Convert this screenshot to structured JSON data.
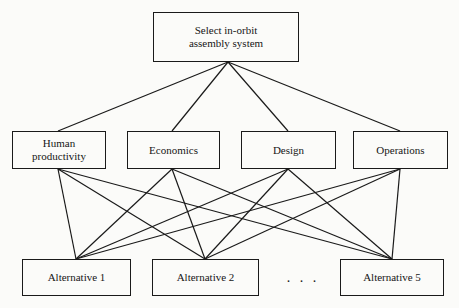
{
  "diagram": {
    "title": "Select in-orbit assembly system",
    "type": "hierarchy-tree",
    "background_color": "#fbfbf9",
    "line_color": "#1a1a1a",
    "text_color": "#161616",
    "goal": {
      "id": "goal",
      "label": "Select in-orbit\nassembly system",
      "x": 153,
      "y": 12,
      "w": 146,
      "h": 50,
      "anchor_bottom": {
        "x": 228,
        "y": 62
      }
    },
    "criteria": [
      {
        "id": "human-productivity",
        "label": "Human\nproductivity",
        "x": 12,
        "y": 131,
        "w": 94,
        "h": 38,
        "anchor_top": {
          "x": 58,
          "y": 131
        },
        "anchor_bottom": {
          "x": 58,
          "y": 169
        }
      },
      {
        "id": "economics",
        "label": "Economics",
        "x": 127,
        "y": 131,
        "w": 93,
        "h": 38,
        "anchor_top": {
          "x": 172,
          "y": 131
        },
        "anchor_bottom": {
          "x": 172,
          "y": 169
        }
      },
      {
        "id": "design",
        "label": "Design",
        "x": 241,
        "y": 131,
        "w": 95,
        "h": 38,
        "anchor_top": {
          "x": 288,
          "y": 131
        },
        "anchor_bottom": {
          "x": 288,
          "y": 169
        }
      },
      {
        "id": "operations",
        "label": "Operations",
        "x": 353,
        "y": 131,
        "w": 95,
        "h": 38,
        "anchor_top": {
          "x": 400,
          "y": 131
        },
        "anchor_bottom": {
          "x": 400,
          "y": 169
        }
      }
    ],
    "alternatives": [
      {
        "id": "alternative-1",
        "label": "Alternative 1",
        "x": 22,
        "y": 259,
        "w": 109,
        "h": 37,
        "anchor_top": {
          "x": 76,
          "y": 259
        }
      },
      {
        "id": "alternative-2",
        "label": "Alternative 2",
        "x": 152,
        "y": 259,
        "w": 107,
        "h": 37,
        "anchor_top": {
          "x": 205,
          "y": 259
        }
      },
      {
        "id": "alternative-5",
        "label": "Alternative 5",
        "x": 340,
        "y": 259,
        "w": 104,
        "h": 37,
        "anchor_top": {
          "x": 392,
          "y": 259
        }
      }
    ],
    "ellipsis": ". . .",
    "edges_goal_to_criteria": [
      {
        "from": "goal",
        "to": "human-productivity"
      },
      {
        "from": "goal",
        "to": "economics"
      },
      {
        "from": "goal",
        "to": "design"
      },
      {
        "from": "goal",
        "to": "operations"
      }
    ],
    "edges_criteria_to_alternatives": [
      {
        "from": "human-productivity",
        "to": "alternative-1"
      },
      {
        "from": "human-productivity",
        "to": "alternative-2"
      },
      {
        "from": "human-productivity",
        "to": "alternative-5"
      },
      {
        "from": "economics",
        "to": "alternative-1"
      },
      {
        "from": "economics",
        "to": "alternative-2"
      },
      {
        "from": "economics",
        "to": "alternative-5"
      },
      {
        "from": "design",
        "to": "alternative-1"
      },
      {
        "from": "design",
        "to": "alternative-2"
      },
      {
        "from": "design",
        "to": "alternative-5"
      },
      {
        "from": "operations",
        "to": "alternative-1"
      },
      {
        "from": "operations",
        "to": "alternative-2"
      },
      {
        "from": "operations",
        "to": "alternative-5"
      }
    ]
  }
}
